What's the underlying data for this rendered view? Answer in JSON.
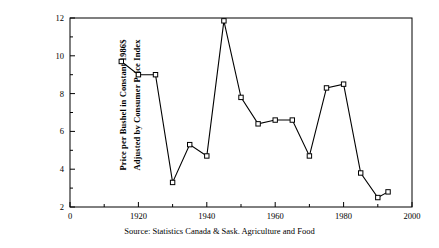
{
  "chart_data": {
    "type": "line",
    "title": "",
    "subtitle": "",
    "xlabel": "",
    "ylabel_line1": "Price per Bushel in Constant 1986$",
    "ylabel_line2": "Adjusted by Consumer Price Index",
    "source_note": "Source: Statistics Canada & Sask. Agriculture and Food",
    "xlim": [
      1900,
      2000
    ],
    "ylim": [
      2,
      12
    ],
    "grid": false,
    "legend": "none",
    "marker": "open-square",
    "line_color": "#000000",
    "x_major_ticks": [
      1900,
      1920,
      1940,
      1960,
      1980,
      2000
    ],
    "x_major_tick_labels": [
      "0",
      "1920",
      "1940",
      "1960",
      "1980",
      "2000"
    ],
    "x_minor_ticks": [
      1910,
      1930,
      1950,
      1970,
      1990
    ],
    "y_major_ticks": [
      2,
      4,
      6,
      8,
      10,
      12
    ],
    "y_major_tick_labels": [
      "2",
      "4",
      "6",
      "8",
      "10",
      "12"
    ],
    "y_minor_ticks": [
      3,
      5,
      7,
      9,
      11
    ],
    "x": [
      1915,
      1920,
      1925,
      1930,
      1935,
      1940,
      1945,
      1950,
      1955,
      1960,
      1965,
      1970,
      1975,
      1980,
      1985,
      1990,
      1993
    ],
    "values": [
      9.7,
      9.0,
      9.0,
      3.3,
      5.3,
      4.7,
      11.85,
      7.8,
      6.4,
      6.6,
      6.6,
      4.7,
      8.3,
      8.5,
      3.8,
      2.5,
      2.8
    ],
    "series": [
      {
        "name": "Price per Bushel (Constant 1986$)",
        "points": [
          {
            "x": 1915,
            "y": 9.7
          },
          {
            "x": 1920,
            "y": 9.0
          },
          {
            "x": 1925,
            "y": 9.0
          },
          {
            "x": 1930,
            "y": 3.3
          },
          {
            "x": 1935,
            "y": 5.3
          },
          {
            "x": 1940,
            "y": 4.7
          },
          {
            "x": 1945,
            "y": 11.85
          },
          {
            "x": 1950,
            "y": 7.8
          },
          {
            "x": 1955,
            "y": 6.4
          },
          {
            "x": 1960,
            "y": 6.6
          },
          {
            "x": 1965,
            "y": 6.6
          },
          {
            "x": 1970,
            "y": 4.7
          },
          {
            "x": 1975,
            "y": 8.3
          },
          {
            "x": 1980,
            "y": 8.5
          },
          {
            "x": 1985,
            "y": 3.8
          },
          {
            "x": 1990,
            "y": 2.5
          },
          {
            "x": 1993,
            "y": 2.8
          }
        ]
      }
    ]
  }
}
